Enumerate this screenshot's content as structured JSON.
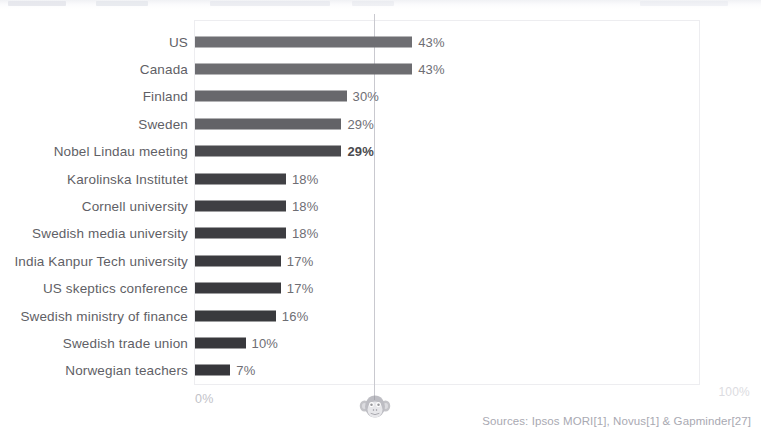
{
  "chart_data": {
    "type": "bar",
    "orientation": "horizontal",
    "title": "",
    "xlabel": "",
    "ylabel": "",
    "xlim": [
      0,
      100
    ],
    "grid": false,
    "legend": null,
    "categories": [
      "US",
      "Canada",
      "Finland",
      "Sweden",
      "Nobel Lindau meeting",
      "Karolinska Institutet",
      "Cornell university",
      "Swedish media university",
      "India Kanpur Tech university",
      "US skeptics conference",
      "Swedish ministry of finance",
      "Swedish trade union",
      "Norwegian teachers"
    ],
    "values": [
      43,
      43,
      30,
      29,
      29,
      18,
      18,
      18,
      17,
      17,
      16,
      10,
      7
    ],
    "value_labels": [
      "43%",
      "43%",
      "30%",
      "29%",
      "29%",
      "18%",
      "18%",
      "18%",
      "17%",
      "17%",
      "16%",
      "10%",
      "7%"
    ],
    "bar_colors": [
      "#6f6f73",
      "#6d6d71",
      "#68686c",
      "#636367",
      "#4a4a4e",
      "#414145",
      "#3f3f43",
      "#3d3d41",
      "#3b3b3f",
      "#3a3a3e",
      "#393a3d",
      "#38383c",
      "#37373b"
    ],
    "reference_line": {
      "label": "chance",
      "value": 35,
      "marker_icon": "chimpanzee-icon",
      "color": "#c9c9cf"
    },
    "axis_ticks": [
      "0%",
      "100%"
    ]
  },
  "axis": {
    "zero_label": "0%",
    "max_label": "100%"
  },
  "footer": {
    "sources": "Sources: Ipsos MORI[1], Novus[1] & Gapminder[27]"
  }
}
